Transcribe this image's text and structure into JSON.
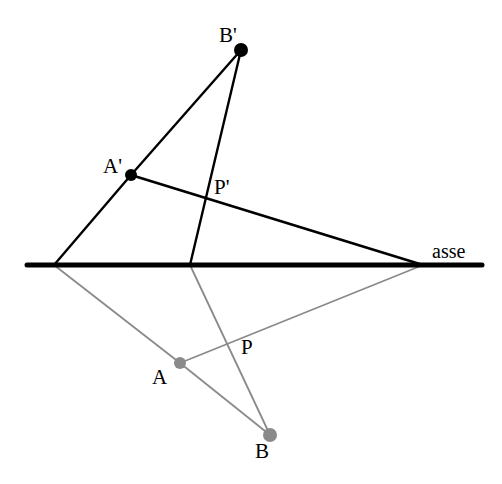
{
  "figure": {
    "title_visible": false,
    "background_color": "#ffffff",
    "width": 502,
    "height": 484
  },
  "colors": {
    "primary_stroke": "#000000",
    "reflected_stroke": "#8a8a8a",
    "axis_stroke": "#000000",
    "label_color": "#000000"
  },
  "axis": {
    "label": "asse",
    "label_x": 432,
    "label_y": 241,
    "x1": 27,
    "y1": 265,
    "x2": 482,
    "y2": 265,
    "stroke_width": 5
  },
  "points": {
    "A_prime": {
      "label": "A'",
      "x": 131,
      "y": 175,
      "label_x": 103,
      "label_y": 156,
      "marker": "filled-dot",
      "color": "#000000",
      "radius": 6
    },
    "B_prime": {
      "label": "B'",
      "x": 241,
      "y": 50,
      "label_x": 219,
      "label_y": 25,
      "marker": "filled-dot",
      "color": "#000000",
      "radius": 7
    },
    "P_prime": {
      "label": "P'",
      "x": 206,
      "y": 196,
      "label_x": 214,
      "label_y": 177,
      "marker": "none",
      "color": "#000000",
      "radius": 0
    },
    "A": {
      "label": "A",
      "x": 180,
      "y": 363,
      "label_x": 152,
      "label_y": 367,
      "marker": "filled-dot",
      "color": "#8a8a8a",
      "radius": 6
    },
    "B": {
      "label": "B",
      "x": 270,
      "y": 435,
      "label_x": 255,
      "label_y": 441,
      "marker": "filled-dot",
      "color": "#8a8a8a",
      "radius": 7
    },
    "P": {
      "label": "P",
      "x": 226,
      "y": 347,
      "label_x": 241,
      "label_y": 337,
      "marker": "none",
      "color": "#8a8a8a",
      "radius": 0
    }
  },
  "axis_nodes": {
    "left_node": {
      "x": 54,
      "y": 265
    },
    "mid_node": {
      "x": 190,
      "y": 265
    },
    "right_node": {
      "x": 423,
      "y": 265
    }
  },
  "segments": {
    "upper": [
      {
        "name": "left-node-to-A-prime",
        "x1": 54,
        "y1": 265,
        "x2": 131,
        "y2": 175,
        "color": "#000000",
        "width": 2.4
      },
      {
        "name": "A-prime-to-B-prime",
        "x1": 131,
        "y1": 175,
        "x2": 241,
        "y2": 50,
        "color": "#000000",
        "width": 2.4
      },
      {
        "name": "B-prime-to-mid-node",
        "x1": 241,
        "y1": 50,
        "x2": 190,
        "y2": 265,
        "color": "#000000",
        "width": 2.4
      },
      {
        "name": "A-prime-to-right-node",
        "x1": 131,
        "y1": 175,
        "x2": 423,
        "y2": 265,
        "color": "#000000",
        "width": 2.8
      }
    ],
    "lower": [
      {
        "name": "left-node-to-A",
        "x1": 54,
        "y1": 265,
        "x2": 180,
        "y2": 363,
        "color": "#8a8a8a",
        "width": 1.8
      },
      {
        "name": "A-to-B",
        "x1": 180,
        "y1": 363,
        "x2": 270,
        "y2": 435,
        "color": "#8a8a8a",
        "width": 1.8
      },
      {
        "name": "B-to-mid-node",
        "x1": 270,
        "y1": 435,
        "x2": 190,
        "y2": 265,
        "color": "#8a8a8a",
        "width": 1.8
      },
      {
        "name": "A-to-right-node",
        "x1": 180,
        "y1": 363,
        "x2": 423,
        "y2": 265,
        "color": "#8a8a8a",
        "width": 1.8
      }
    ]
  }
}
